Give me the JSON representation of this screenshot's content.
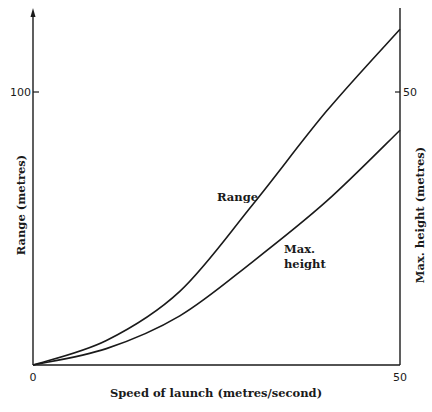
{
  "chart_data": {
    "type": "line",
    "title": "",
    "xlabel": "Speed of launch (metres/second)",
    "ylabel": "Range (metres)",
    "y2label": "Max. height (metres)",
    "x": [
      0,
      10,
      20,
      30,
      40,
      50
    ],
    "xlim": [
      0,
      50
    ],
    "ylim": [
      0,
      130
    ],
    "y2lim": [
      0,
      65
    ],
    "xticks": [
      "0",
      "50"
    ],
    "yticks": [
      "100"
    ],
    "y2ticks": [
      "50"
    ],
    "grid": false,
    "legend": "inline labels",
    "series": [
      {
        "name": "Range",
        "axis": "left",
        "values": [
          0,
          9,
          27,
          59,
          93,
          123
        ]
      },
      {
        "name": "Max. height",
        "axis": "right",
        "values": [
          0,
          3,
          9,
          19,
          30,
          43
        ]
      }
    ]
  },
  "labels": {
    "x_axis": "Speed of launch (metres/second)",
    "y_left": "Range (metres)",
    "y_right": "Max. height (metres)",
    "tick_x0": "0",
    "tick_x50": "50",
    "tick_y100": "100",
    "tick_y2_50": "50",
    "series_range": "Range",
    "series_height_1": "Max.",
    "series_height_2": "height"
  }
}
